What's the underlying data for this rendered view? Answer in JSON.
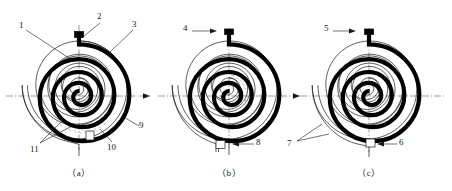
{
  "sheet": {
    "title": "Scroll spiral wrap configurations",
    "width": 452,
    "height": 191,
    "background": "#ffffff",
    "line_color": "#1a1a1a",
    "axis_color": "#555555",
    "fill_color": "#000000"
  },
  "figures": [
    {
      "id": "fig-a",
      "caption": "（a）",
      "center": {
        "x": 79,
        "y": 96
      },
      "labels": [
        {
          "id": "1",
          "text": "1",
          "x": 20,
          "y": 21,
          "leader": "M26 30 L72 60"
        },
        {
          "id": "2",
          "text": "2",
          "x": 98,
          "y": 13,
          "leader": "M100 23 L84 36"
        },
        {
          "id": "3",
          "text": "3",
          "x": 133,
          "y": 21,
          "leader": "M133 30 L110 52"
        },
        {
          "id": "9",
          "text": "9",
          "x": 140,
          "y": 124,
          "leader": "M139 126 L122 116"
        },
        {
          "id": "10",
          "text": "10",
          "x": 108,
          "y": 145,
          "leader": "M112 142 L100 129"
        },
        {
          "id": "11",
          "text": "11",
          "x": 32,
          "y": 147,
          "leader": "M40 143 L63 120 M40 143 L72 126"
        }
      ]
    },
    {
      "id": "fig-b",
      "caption": "（b）",
      "center": {
        "x": 229,
        "y": 96
      },
      "labels": [
        {
          "id": "4",
          "text": "4",
          "x": 185,
          "y": 26,
          "leader": "M192 31 L215 31",
          "arrow": "right"
        },
        {
          "id": "8",
          "text": "8",
          "x": 256,
          "y": 140,
          "leader": "M254 144 L233 144",
          "arrow": "left"
        }
      ]
    },
    {
      "id": "fig-c",
      "caption": "（c）",
      "center": {
        "x": 369,
        "y": 96
      },
      "labels": [
        {
          "id": "5",
          "text": "5",
          "x": 326,
          "y": 26,
          "leader": "M333 31 L352 31",
          "arrow": "right"
        },
        {
          "id": "6",
          "text": "6",
          "x": 399,
          "y": 140,
          "leader": "M396 144 L378 144",
          "arrow": "left"
        },
        {
          "id": "7",
          "text": "7",
          "x": 288,
          "y": 142,
          "leader": "M295 139 L320 124 M295 139 L326 132"
        }
      ]
    }
  ],
  "captions": {
    "a": "（a）",
    "b": "（b）",
    "c": "（c）"
  },
  "reference_numerals": [
    "1",
    "2",
    "3",
    "4",
    "5",
    "6",
    "7",
    "8",
    "9",
    "10",
    "11"
  ],
  "axis": {
    "style": "dash-dot centerline",
    "arrow_direction": "right"
  }
}
